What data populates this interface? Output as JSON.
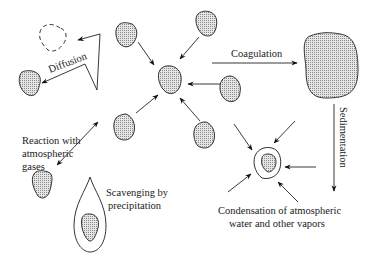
{
  "diagram": {
    "labels": {
      "diffusion": "Diffusion",
      "coagulation": "Coagulation",
      "sedimentation": "Sedimentation",
      "reaction_line1": "Reaction with",
      "reaction_line2": "atmospheric",
      "reaction_line3": "gases",
      "scavenging_line1": "Scavenging by",
      "scavenging_line2": "precipitation",
      "condensation_line1": "Condensation of atmospheric",
      "condensation_line2": "water and other vapors"
    },
    "colors": {
      "stroke": "#222222",
      "particle_fill": "#bdbdbd",
      "background": "#ffffff"
    },
    "nodes": [
      {
        "id": "dashed-particle",
        "desc": "former particle position (dashed outline)"
      },
      {
        "id": "diffused-particle",
        "desc": "particle after diffusion"
      },
      {
        "id": "central-particle",
        "desc": "coagulating particle"
      },
      {
        "id": "large-particle",
        "desc": "coagulated large particle"
      },
      {
        "id": "reacting-particle",
        "desc": "particle reacting with gases"
      },
      {
        "id": "raindrop-particle",
        "desc": "particle inside precipitation drop"
      },
      {
        "id": "condensation-particle",
        "desc": "particle with condensed vapor shell"
      }
    ]
  }
}
